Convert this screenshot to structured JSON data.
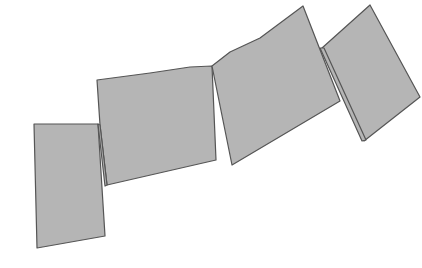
{
  "diagram": {
    "fill": "#b5b5b5",
    "stroke": "#555555",
    "background": "#ffffff",
    "panels": [
      {
        "name": "panel-1",
        "points": "34,124 98,124 105,236 37,248"
      },
      {
        "name": "panel-2",
        "points": "97,80 150,73 190,67 212,66 216,160 107,185 100,125"
      },
      {
        "name": "panel-3",
        "points": "212,66 230,52 260,38 303,6 340,101 232,165"
      },
      {
        "name": "panel-4",
        "points": "322,48 370,5 420,97 364,141"
      },
      {
        "name": "fold-1",
        "points": "98,124 100,125 107,185 105,186"
      },
      {
        "name": "fold-2",
        "points": "320,48 324,48 366,140 362,141"
      }
    ]
  }
}
